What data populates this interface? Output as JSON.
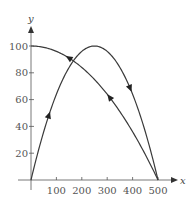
{
  "chart_data": {
    "type": "line",
    "title": "",
    "xlabel": "x",
    "ylabel": "y",
    "xlim": [
      0,
      500
    ],
    "ylim": [
      0,
      100
    ],
    "x_ticks": [
      100,
      200,
      300,
      400,
      500
    ],
    "y_ticks": [
      20,
      40,
      60,
      80,
      100
    ],
    "grid": false,
    "legend": null,
    "series": [
      {
        "name": "parabola-up-down",
        "direction": "from (0,0) up to peak (250,100) then down to (500,0)",
        "x": [
          0,
          50,
          100,
          150,
          200,
          250,
          300,
          350,
          400,
          450,
          500
        ],
        "y": [
          0,
          36,
          64,
          84,
          96,
          100,
          96,
          84,
          64,
          36,
          0
        ]
      },
      {
        "name": "concave-down-return",
        "direction": "from (500,0) back up-left to (0,100)",
        "x": [
          0,
          50,
          100,
          150,
          200,
          250,
          300,
          350,
          400,
          450,
          500
        ],
        "y": [
          100,
          99,
          96,
          91,
          84,
          75,
          64,
          51,
          36,
          19,
          0
        ]
      }
    ]
  },
  "axes": {
    "x_label": "x",
    "y_label": "y",
    "x_tick_labels": [
      "100",
      "200",
      "300",
      "400",
      "500"
    ],
    "y_tick_labels": [
      "20",
      "40",
      "60",
      "80",
      "100"
    ]
  }
}
